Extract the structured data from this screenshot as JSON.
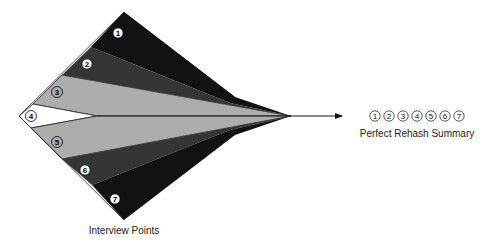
{
  "diagram": {
    "left_label": "Interview Points",
    "right_label": "Perfect Rehash Summary",
    "bands": [
      {
        "id": "1",
        "label": "1",
        "color": "#121212"
      },
      {
        "id": "2",
        "label": "2",
        "color": "#353535"
      },
      {
        "id": "3",
        "label": "3",
        "color": "#adadad"
      },
      {
        "id": "4",
        "label": "4",
        "color": "#ffffff"
      },
      {
        "id": "5",
        "label": "5",
        "color": "#adadad"
      },
      {
        "id": "6",
        "label": "6",
        "color": "#353535"
      },
      {
        "id": "7",
        "label": "7",
        "color": "#121212"
      }
    ],
    "summary_numbers": [
      "1",
      "2",
      "3",
      "4",
      "5",
      "6",
      "7"
    ]
  }
}
